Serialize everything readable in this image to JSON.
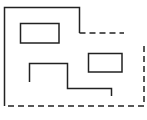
{
  "diagram": {
    "width": 147,
    "height": 120,
    "background": "#ffffff",
    "stroke_color": "#222222",
    "stroke_width": 1.5,
    "dash_pattern": "6,4",
    "outline_solid": {
      "points": "4.5,106 4.5,7.5 79.5,7.5 79.5,33"
    },
    "outline_dashed": {
      "points": "79.5,33 124,33"
    },
    "outline_dashed_right_bottom": {
      "points": "144,46 144,106 4.5,106"
    },
    "rooms": [
      {
        "x": 20.5,
        "y": 23.5,
        "width": 38.5,
        "height": 19.5
      },
      {
        "x": 88.5,
        "y": 53.5,
        "width": 33.5,
        "height": 18.5
      }
    ],
    "wall_path": {
      "points": "29.5,82 29.5,63.5 67.5,63.5 67.5,88.5 111.5,88.5 111.5,96"
    }
  }
}
